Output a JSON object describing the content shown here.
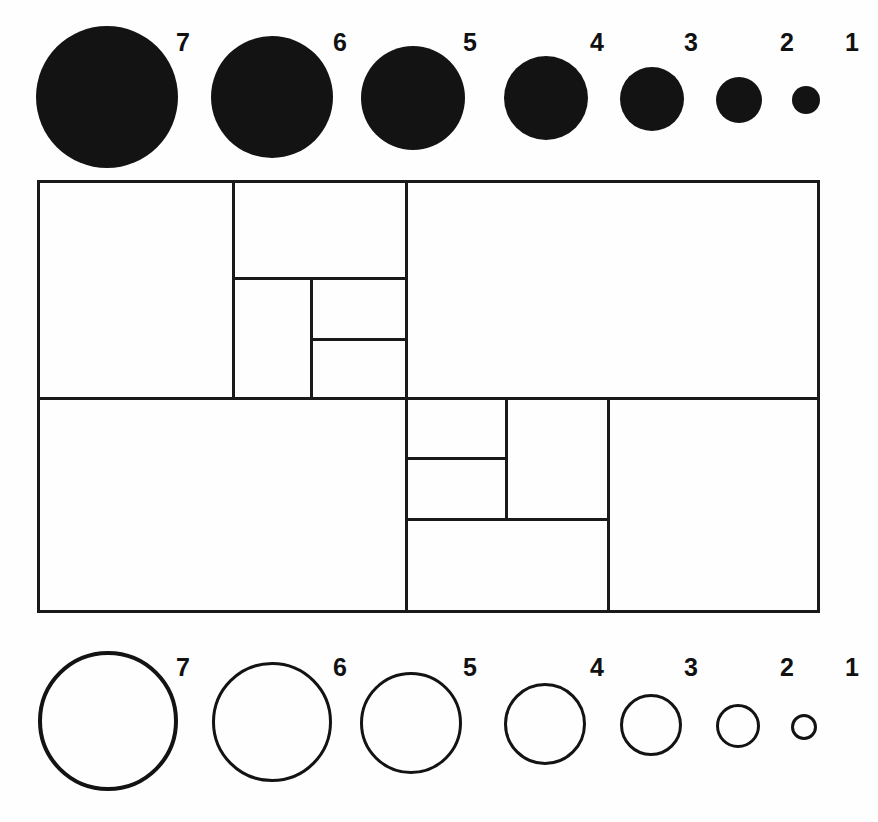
{
  "figure": {
    "background_color": "#ffffff",
    "ink_color": "#131313",
    "line_color": "#1a1a1a",
    "width": 878,
    "height": 822
  },
  "top_row": {
    "name": "filled-discs-row",
    "style": "filled",
    "labels": [
      "7",
      "6",
      "5",
      "4",
      "3",
      "2",
      "1"
    ],
    "items": [
      {
        "label": "7",
        "cx": 107,
        "cy": 97,
        "r": 71,
        "label_x": 176,
        "label_y": 30
      },
      {
        "label": "6",
        "cx": 272,
        "cy": 97,
        "r": 61,
        "label_x": 333,
        "label_y": 30
      },
      {
        "label": "5",
        "cx": 413,
        "cy": 98,
        "r": 52,
        "label_x": 463,
        "label_y": 30
      },
      {
        "label": "4",
        "cx": 546,
        "cy": 98,
        "r": 42,
        "label_x": 590,
        "label_y": 30
      },
      {
        "label": "3",
        "cx": 652,
        "cy": 99,
        "r": 32,
        "label_x": 684,
        "label_y": 30
      },
      {
        "label": "2",
        "cx": 739,
        "cy": 100,
        "r": 23,
        "label_x": 780,
        "label_y": 30
      },
      {
        "label": "1",
        "cx": 806,
        "cy": 100,
        "r": 14,
        "label_x": 845,
        "label_y": 30
      }
    ]
  },
  "bottom_row": {
    "name": "outlined-circles-row",
    "style": "outline",
    "labels": [
      "7",
      "6",
      "5",
      "4",
      "3",
      "2",
      "1"
    ],
    "items": [
      {
        "label": "7",
        "cx": 108,
        "cy": 721,
        "r": 70,
        "stroke": 4,
        "label_x": 176,
        "label_y": 655
      },
      {
        "label": "6",
        "cx": 272,
        "cy": 722,
        "r": 60,
        "stroke": 3.5,
        "label_x": 333,
        "label_y": 655
      },
      {
        "label": "5",
        "cx": 411,
        "cy": 723,
        "r": 51,
        "stroke": 3.5,
        "label_x": 463,
        "label_y": 655
      },
      {
        "label": "4",
        "cx": 545,
        "cy": 724,
        "r": 41,
        "stroke": 3,
        "label_x": 590,
        "label_y": 655
      },
      {
        "label": "3",
        "cx": 651,
        "cy": 725,
        "r": 31,
        "stroke": 3,
        "label_x": 684,
        "label_y": 655
      },
      {
        "label": "2",
        "cx": 738,
        "cy": 726,
        "r": 22,
        "stroke": 3,
        "label_x": 780,
        "label_y": 655
      },
      {
        "label": "1",
        "cx": 804,
        "cy": 727,
        "r": 13,
        "stroke": 3,
        "label_x": 845,
        "label_y": 655
      }
    ]
  },
  "grid": {
    "name": "rectangle-partition",
    "outer": {
      "x": 37,
      "y": 180,
      "w": 783,
      "h": 433
    },
    "lines": [
      {
        "name": "mid-horizontal-divider",
        "type": "h",
        "x": 37,
        "y": 397,
        "len": 783,
        "w": 3
      },
      {
        "name": "top-left-vertical-split",
        "type": "v",
        "x": 232,
        "y": 180,
        "len": 217,
        "w": 3
      },
      {
        "name": "top-mid-vertical-split",
        "type": "v",
        "x": 310,
        "y": 277,
        "len": 120,
        "w": 3
      },
      {
        "name": "top-right-vertical-split",
        "type": "v",
        "x": 405,
        "y": 180,
        "len": 217,
        "w": 3
      },
      {
        "name": "top-inner-horizontal-a",
        "type": "h",
        "x": 232,
        "y": 277,
        "len": 173,
        "w": 3
      },
      {
        "name": "top-inner-horizontal-b",
        "type": "h",
        "x": 310,
        "y": 338,
        "len": 95,
        "w": 3
      },
      {
        "name": "bottom-left-vertical-split",
        "type": "v",
        "x": 405,
        "y": 397,
        "len": 216,
        "w": 3
      },
      {
        "name": "bottom-mid-vertical-split",
        "type": "v",
        "x": 505,
        "y": 397,
        "len": 121,
        "w": 3
      },
      {
        "name": "bottom-right-vertical-split",
        "type": "v",
        "x": 607,
        "y": 397,
        "len": 216,
        "w": 3
      },
      {
        "name": "bottom-inner-horizontal-a",
        "type": "h",
        "x": 405,
        "y": 457,
        "len": 100,
        "w": 3
      },
      {
        "name": "bottom-inner-horizontal-b",
        "type": "h",
        "x": 405,
        "y": 518,
        "len": 202,
        "w": 3
      }
    ]
  }
}
